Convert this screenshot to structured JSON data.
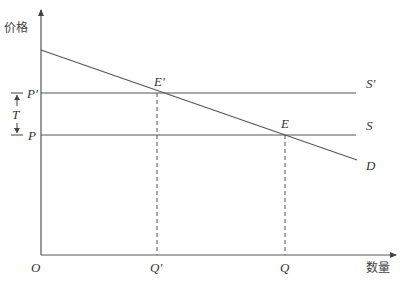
{
  "diagram": {
    "type": "supply-demand-tax",
    "axes": {
      "y_label": "价格",
      "x_label": "数量",
      "origin_label": "O"
    },
    "price_labels": {
      "p_prime": "P'",
      "p": "P",
      "tax": "T"
    },
    "quantity_labels": {
      "q_prime": "Q'",
      "q": "Q"
    },
    "curve_labels": {
      "s_prime": "S'",
      "s": "S",
      "d": "D"
    },
    "point_labels": {
      "e_prime": "E'",
      "e": "E"
    },
    "colors": {
      "line": "#555555",
      "text": "#333333",
      "background": "#ffffff"
    }
  }
}
